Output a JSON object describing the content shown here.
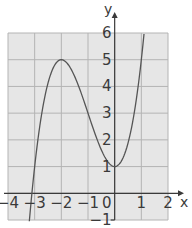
{
  "chart_data": {
    "type": "line",
    "title": "",
    "xlabel": "x",
    "ylabel": "y",
    "xlim": [
      -4,
      2
    ],
    "ylim": [
      -1,
      6
    ],
    "grid": true,
    "x_ticks": [
      "-4",
      "-3",
      "-2",
      "-1",
      "0",
      "1",
      "2"
    ],
    "y_ticks": [
      "-1",
      "1",
      "2",
      "3",
      "4",
      "5",
      "6"
    ],
    "origin_label": "0",
    "series": [
      {
        "name": "y = x^3 + 3x^2 + 1",
        "x": [
          -3.2,
          -3.0,
          -2.5,
          -2.0,
          -1.5,
          -1.0,
          -0.5,
          0.0,
          0.5,
          1.0,
          1.1
        ],
        "y": [
          -1.05,
          1.0,
          3.5,
          5.0,
          4.4,
          3.0,
          1.6,
          1.0,
          1.9,
          5.0,
          5.96
        ]
      }
    ],
    "annotations": {
      "local_max": [
        -2,
        5
      ],
      "local_min": [
        0,
        1
      ]
    }
  },
  "colors": {
    "plot_bg": "#e6e6e6",
    "grid": "#b4b4b4",
    "axis": "#3a3a3a",
    "curve": "#555555"
  }
}
